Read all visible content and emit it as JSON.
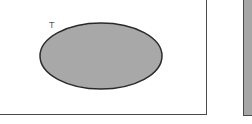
{
  "diagram": {
    "set_label": "T",
    "colors": {
      "ellipse_fill": "#a8a8a8",
      "ellipse_stroke": "#2a2a2a",
      "panel_border": "#4a4a4a",
      "right_panel_fill": "#a6a6a6"
    }
  }
}
